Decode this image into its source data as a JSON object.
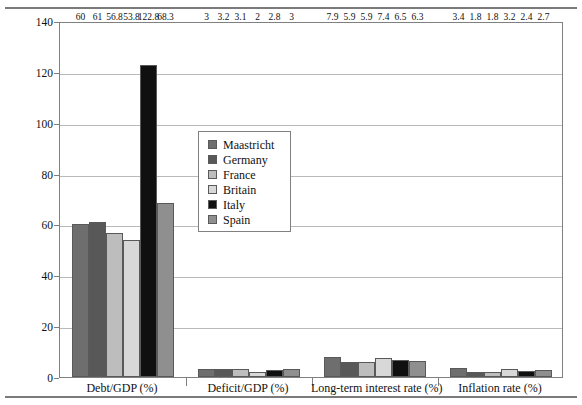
{
  "chart_data": {
    "type": "bar",
    "title": "",
    "xlabel": "",
    "ylabel": "Economic yardsticks (%)",
    "ylim": [
      0,
      140
    ],
    "yticks": [
      0,
      20,
      40,
      60,
      80,
      100,
      120,
      140
    ],
    "grid": "horizontal",
    "legend_position": "inside-upper-left-center",
    "categories": [
      "Debt/GDP (%)",
      "Deficit/GDP (%)",
      "Long-term interest rate (%)",
      "Inflation rate (%)"
    ],
    "series": [
      {
        "name": "Maastricht",
        "color": "#6e6e6e",
        "values": [
          60,
          3,
          7.9,
          3.4
        ]
      },
      {
        "name": "Germany",
        "color": "#585858",
        "values": [
          61,
          3.2,
          5.9,
          1.8
        ]
      },
      {
        "name": "France",
        "color": "#bdbdbd",
        "values": [
          56.8,
          3.1,
          5.9,
          1.8
        ]
      },
      {
        "name": "Britain",
        "color": "#d8d8d8",
        "values": [
          53.8,
          2,
          7.4,
          3.2
        ]
      },
      {
        "name": "Italy",
        "color": "#101010",
        "values": [
          122.8,
          2.8,
          6.5,
          2.4
        ]
      },
      {
        "name": "Spain",
        "color": "#8f8f8f",
        "values": [
          68.3,
          3,
          6.3,
          2.7
        ]
      }
    ],
    "value_labels": {
      "Debt/GDP (%)": [
        "60",
        "61",
        "56.8",
        "53.8",
        "122.8",
        "68.3"
      ],
      "Deficit/GDP (%)": [
        "3",
        "3.2",
        "3.1",
        "2",
        "2.8",
        "3"
      ],
      "Long-term interest rate (%)": [
        "7.9",
        "5.9",
        "5.9",
        "7.4",
        "6.5",
        "6.3"
      ],
      "Inflation rate (%)": [
        "3.4",
        "1.8",
        "1.8",
        "3.2",
        "2.4",
        "2.7"
      ]
    }
  }
}
